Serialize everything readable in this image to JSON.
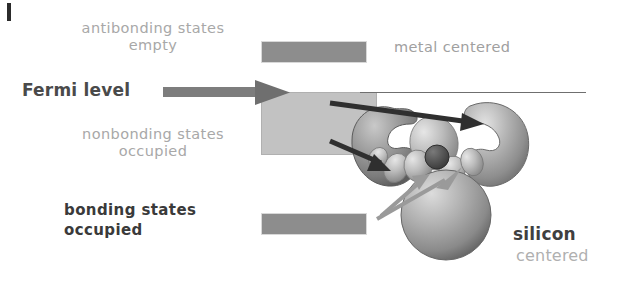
{
  "figure": {
    "background_color": "#ffffff"
  },
  "labels": {
    "antibonding": "antibonding states\nempty",
    "nonbonding": "nonbonding states\noccupied",
    "bonding": "bonding states\noccupied",
    "fermi_level": "Fermi level",
    "metal_centered": "metal centered",
    "silicon": "silicon",
    "centered": "centered"
  },
  "bands": [
    {
      "name": "antibonding-band",
      "label": "antibonding states empty",
      "color": "#8d8d8d",
      "x": 261,
      "y": 41,
      "width": 104,
      "height": 20
    },
    {
      "name": "nonbonding-band",
      "label": "nonbonding states occupied",
      "color": "#c2c2c2",
      "x": 261,
      "y": 92,
      "width": 114,
      "height": 61
    },
    {
      "name": "bonding-band",
      "label": "bonding states occupied",
      "color": "#8d8d8d",
      "x": 261,
      "y": 213,
      "width": 104,
      "height": 20
    }
  ],
  "fermi_line": {
    "color": "#6f6f6f",
    "x1": 360,
    "x2": 586,
    "y": 92
  },
  "arrows": [
    {
      "name": "fermi-pointer-arrow",
      "color": "#7d7d7d",
      "from": [
        163,
        92
      ],
      "to": [
        288,
        92
      ],
      "description": "thick gray arrow from Fermi level text to nonbonding band"
    },
    {
      "name": "metal-orbital-arrow",
      "color": "#2f2f2f",
      "from": [
        330,
        103
      ],
      "to": [
        480,
        124
      ],
      "description": "dark arrow pointing to metal-centered lobe"
    },
    {
      "name": "left-lobe-arrow",
      "color": "#2f2f2f",
      "from": [
        330,
        141
      ],
      "to": [
        388,
        168
      ],
      "description": "dark arrow pointing to left orbital lobe"
    },
    {
      "name": "silicon-orbital-arrow",
      "color": "#9a9a9a",
      "from": [
        377,
        218
      ],
      "to": [
        470,
        168
      ],
      "description": "light double-headed arrow from bonding band to silicon-centered orbitals"
    }
  ],
  "molecule": {
    "name": "metal-silicide-orbital-isosurface",
    "description": "3D isosurface rendering of molecular orbitals with two large kidney-shaped lobes, a lower sphere and a cluster of small lobes",
    "lobe_color": "#a6a6a6",
    "highlight_color": "#d6d6d6",
    "shadow_color": "#6e6e6e",
    "core_color": "#4a4a4a"
  },
  "edge_tick": {
    "name": "page-edge-mark",
    "color": "#2b2b2b"
  }
}
